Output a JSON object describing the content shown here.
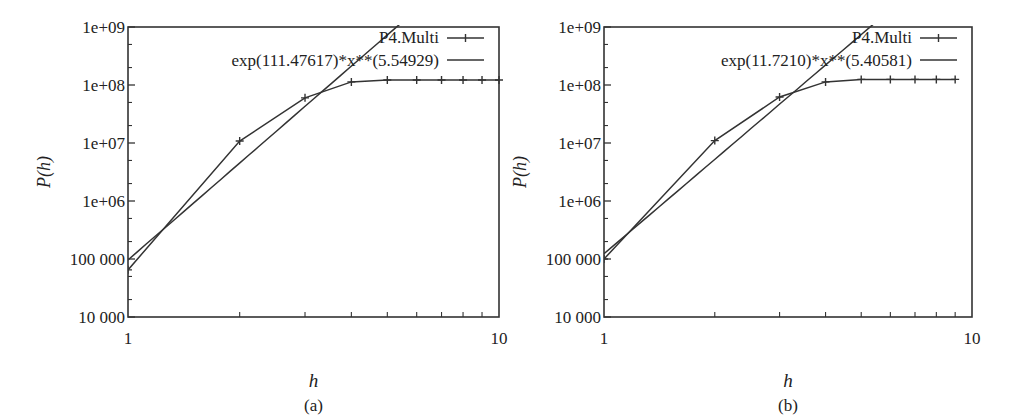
{
  "figure": {
    "panels": [
      {
        "caption": "(a)",
        "xlabel": "h",
        "ylabel": "P(h)",
        "legend": [
          "P4.Multi",
          "exp(111.47617)*x**(5.54929)"
        ]
      },
      {
        "caption": "(b)",
        "xlabel": "h",
        "ylabel": "P(h)",
        "legend": [
          "P4.Multi",
          "exp(11.7210)*x**(5.40581)"
        ]
      }
    ]
  },
  "chart_data": [
    {
      "type": "line",
      "title": "(a)",
      "xlabel": "h",
      "ylabel": "P(h)",
      "xscale": "log",
      "yscale": "log",
      "xlim": [
        1,
        10
      ],
      "ylim": [
        10000,
        1000000000
      ],
      "xticks": [
        "1",
        "10"
      ],
      "yticks": [
        "10 000",
        "100 000",
        "1e+06",
        "1e+07",
        "1e+08",
        "1e+09"
      ],
      "grid": false,
      "legend_position": "top-right",
      "series": [
        {
          "name": "P4.Multi",
          "marker": "+",
          "x": [
            1,
            2,
            3,
            4,
            5,
            6,
            7,
            8,
            9,
            10
          ],
          "y": [
            65000,
            10800000,
            60000000,
            113000000,
            122000000,
            122000000,
            122000000,
            122000000,
            122000000,
            122000000
          ]
        },
        {
          "name": "exp(111.47617)*x**(5.54929)",
          "marker": "none",
          "fit": {
            "a_ln": 11.47617,
            "b": 5.54929
          },
          "x": [
            1,
            5.3
          ],
          "y": [
            96000,
            1000000000
          ]
        }
      ]
    },
    {
      "type": "line",
      "title": "(b)",
      "xlabel": "h",
      "ylabel": "P(h)",
      "xscale": "log",
      "yscale": "log",
      "xlim": [
        1,
        10
      ],
      "ylim": [
        10000,
        1000000000
      ],
      "xticks": [
        "1",
        "10"
      ],
      "yticks": [
        "10 000",
        "100 000",
        "1e+06",
        "1e+07",
        "1e+08",
        "1e+09"
      ],
      "grid": false,
      "legend_position": "top-right",
      "series": [
        {
          "name": "P4.Multi",
          "marker": "+",
          "x": [
            1,
            2,
            3,
            4,
            5,
            6,
            7,
            8,
            9
          ],
          "y": [
            100000,
            11000000,
            62000000,
            113000000,
            125000000,
            125000000,
            125000000,
            125000000,
            125000000
          ]
        },
        {
          "name": "exp(11.7210)*x**(5.40581)",
          "marker": "none",
          "fit": {
            "a_ln": 11.721,
            "b": 5.40581
          },
          "x": [
            1,
            5.3
          ],
          "y": [
            123000,
            1000000000
          ]
        }
      ]
    }
  ]
}
